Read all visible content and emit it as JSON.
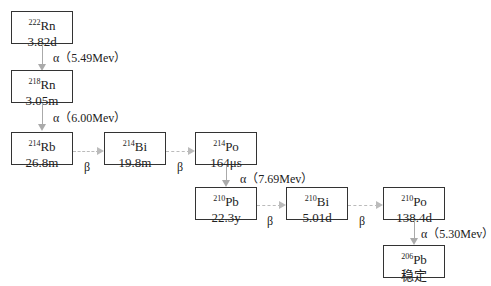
{
  "nuclides": [
    {
      "mass": "222",
      "symbol": "Rn",
      "halflife": "3.82d"
    },
    {
      "mass": "218",
      "symbol": "Rn",
      "halflife": "3.05m"
    },
    {
      "mass": "214",
      "symbol": "Rb",
      "halflife": "26.8m"
    },
    {
      "mass": "214",
      "symbol": "Bi",
      "halflife": "19.8m"
    },
    {
      "mass": "214",
      "symbol": "Po",
      "halflife": "164μs"
    },
    {
      "mass": "210",
      "symbol": "Pb",
      "halflife": "22.3y"
    },
    {
      "mass": "210",
      "symbol": "Bi",
      "halflife": "5.01d"
    },
    {
      "mass": "210",
      "symbol": "Po",
      "halflife": "138.4d"
    },
    {
      "mass": "206",
      "symbol": "Pb",
      "halflife": "稳定"
    }
  ],
  "decays": [
    {
      "type": "alpha",
      "label": "α（5.49Mev）"
    },
    {
      "type": "alpha",
      "label": "α（6.00Mev）"
    },
    {
      "type": "beta",
      "label": "β"
    },
    {
      "type": "beta",
      "label": "β"
    },
    {
      "type": "alpha",
      "label": "α（7.69Mev）"
    },
    {
      "type": "beta",
      "label": "β"
    },
    {
      "type": "beta",
      "label": "β"
    },
    {
      "type": "alpha",
      "label": "α（5.30Mev）"
    }
  ],
  "colors": {
    "box_border": "#333333",
    "alpha_arrow": "#aaaaaa",
    "beta_arrow": "#bbbbbb"
  }
}
